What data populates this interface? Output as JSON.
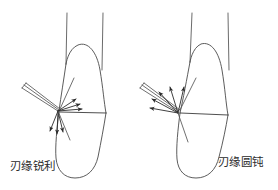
{
  "figure": {
    "background_color": "#ffffff",
    "line_color": "#4a4a4a",
    "arrow_color": "#2a2a2a",
    "width": 278,
    "height": 190
  },
  "panels": [
    {
      "id": "left",
      "caption": "刃缘锐利",
      "caption_x": 10,
      "caption_y": 170,
      "instrument": {
        "name": "sharp-blade-instrument",
        "edge_state": "sharp",
        "blade_lines": 3,
        "contact_point_x": 58,
        "contact_point_y": 111
      },
      "tooth": {
        "name": "tooth-left",
        "crown_apex_y": 62,
        "cervical_line_y": 113,
        "root_apex_y": 178
      },
      "force_vectors": [
        {
          "label": "up-right-1",
          "angle_deg": 22,
          "length": 17
        },
        {
          "label": "right-1",
          "angle_deg": 4,
          "length": 20
        },
        {
          "label": "right-2",
          "angle_deg": 358,
          "length": 22
        },
        {
          "label": "down-1",
          "angle_deg": 260,
          "length": 23
        },
        {
          "label": "down-2",
          "angle_deg": 268,
          "length": 25
        },
        {
          "label": "down-3",
          "angle_deg": 276,
          "length": 22
        }
      ],
      "vector_count": 6
    },
    {
      "id": "right",
      "caption": "刃缘圆钝",
      "caption_x": 218,
      "caption_y": 166,
      "instrument": {
        "name": "dull-blade-instrument",
        "edge_state": "rounded-dull",
        "blade_lines": 3,
        "contact_point_x": 178,
        "contact_point_y": 113
      },
      "tooth": {
        "name": "tooth-right",
        "crown_apex_y": 62,
        "cervical_line_y": 115,
        "root_apex_y": 178
      },
      "force_vectors": [
        {
          "label": "up-1",
          "angle_deg": 78,
          "length": 28
        },
        {
          "label": "up-left-1",
          "angle_deg": 108,
          "length": 30
        },
        {
          "label": "up-left-2",
          "angle_deg": 128,
          "length": 30
        },
        {
          "label": "left-1",
          "angle_deg": 152,
          "length": 30
        },
        {
          "label": "left-2",
          "angle_deg": 172,
          "length": 28
        }
      ],
      "vector_count": 5
    }
  ],
  "labels": {
    "left_caption": "刃缘锐利",
    "right_caption": "刃缘圆钝"
  }
}
